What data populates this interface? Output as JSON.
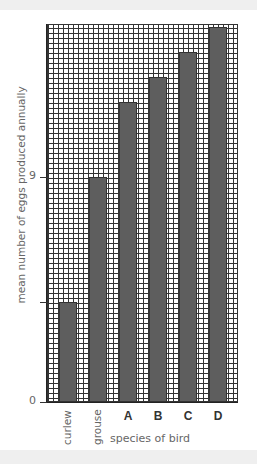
{
  "chart_data": {
    "type": "bar",
    "title": "",
    "categories": [
      "curlew",
      "grouse",
      "A",
      "B",
      "C",
      "D"
    ],
    "values": [
      4,
      9,
      12,
      13,
      14,
      15
    ],
    "xlabel": "species of bird",
    "ylabel": "mean number of eggs produced annually",
    "y_tick_labels": [
      "0",
      "9"
    ],
    "ylim": [
      0,
      15
    ],
    "grid": true,
    "legend": null,
    "bar_color": "#5e5e5e"
  },
  "labels": {
    "ylabel": "mean number of eggs produced annually",
    "xlabel": "species of bird",
    "tick_0": "0",
    "tick_9": "9",
    "cat_0": "curlew",
    "cat_1": "grouse",
    "cat_2": "A",
    "cat_3": "B",
    "cat_4": "C",
    "cat_5": "D"
  }
}
